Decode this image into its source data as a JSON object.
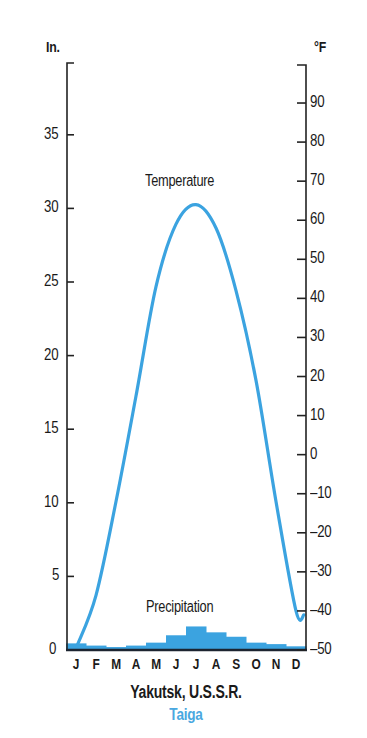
{
  "chart_data": {
    "type": "climograph",
    "title": "Yakutsk, U.S.S.R.",
    "subtitle": "Taiga",
    "categories": [
      "J",
      "F",
      "M",
      "A",
      "M",
      "J",
      "J",
      "A",
      "S",
      "O",
      "N",
      "D"
    ],
    "left_axis": {
      "unit_label": "In.",
      "ticks": [
        0,
        5,
        10,
        15,
        20,
        25,
        30,
        35
      ],
      "range": [
        0,
        38
      ]
    },
    "right_axis": {
      "unit_label": "°F",
      "ticks": [
        -50,
        -40,
        -30,
        -20,
        -10,
        0,
        10,
        20,
        30,
        40,
        50,
        60,
        70,
        80,
        90
      ],
      "tick_labels": [
        "–50",
        "–40",
        "–30",
        "–20",
        "–10",
        "0",
        "10",
        "20",
        "30",
        "40",
        "50",
        "60",
        "70",
        "80",
        "90"
      ],
      "range": [
        -50,
        97
      ]
    },
    "series": [
      {
        "name": "Temperature",
        "type": "line",
        "axis": "right",
        "unit": "°F",
        "values": [
          -49,
          -36,
          -12,
          15,
          43,
          59,
          64,
          58,
          42,
          19,
          -12,
          -40
        ]
      },
      {
        "name": "Precipitation",
        "type": "bar",
        "axis": "left",
        "unit": "in",
        "values": [
          0.45,
          0.3,
          0.2,
          0.3,
          0.5,
          1.0,
          1.6,
          1.2,
          0.9,
          0.5,
          0.4,
          0.25
        ]
      }
    ],
    "grid": false,
    "legend": "inline labels"
  },
  "labels": {
    "left_unit": "In.",
    "right_unit": "°F",
    "temperature": "Temperature",
    "precipitation": "Precipitation",
    "title": "Yakutsk, U.S.S.R.",
    "subtitle": "Taiga"
  },
  "colors": {
    "series": "#3ba3e0",
    "axis": "#222222",
    "text": "#1a1a1a",
    "subtitle": "#4aa8e0"
  }
}
